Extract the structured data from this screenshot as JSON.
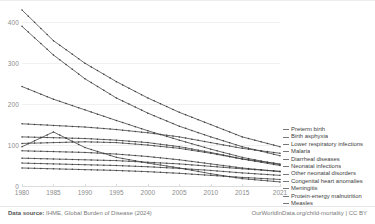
{
  "footer": {
    "source_label": "Data source:",
    "source_text": "IHME, Global Burden of Disease (2024)",
    "attribution": "OurWorldInData.org/child-mortality | CC BY"
  },
  "chart_data": {
    "type": "line",
    "title": "",
    "xlabel": "",
    "ylabel": "",
    "grid": true,
    "legend_position": "right",
    "xlim": [
      1980,
      2021
    ],
    "ylim": [
      0,
      430
    ],
    "yticks": [
      0,
      100,
      200,
      300,
      400
    ],
    "xticks": [
      1980,
      1985,
      1990,
      1995,
      2000,
      2005,
      2010,
      2015,
      2021
    ],
    "x": [
      1980,
      1985,
      1990,
      1995,
      2000,
      2005,
      2010,
      2015,
      2021
    ],
    "series": [
      {
        "name": "Preterm birth",
        "values": [
          430,
          355,
          300,
          255,
          215,
          180,
          150,
          120,
          96
        ]
      },
      {
        "name": "Birth asphyxia",
        "values": [
          390,
          320,
          262,
          215,
          178,
          146,
          120,
          96,
          74
        ]
      },
      {
        "name": "Lower respiratory infections",
        "values": [
          243,
          212,
          186,
          160,
          135,
          112,
          90,
          70,
          52
        ]
      },
      {
        "name": "Malaria",
        "values": [
          152,
          148,
          144,
          138,
          130,
          120,
          106,
          92,
          80
        ]
      },
      {
        "name": "Diarrheal diseases",
        "values": [
          120,
          118,
          116,
          112,
          106,
          96,
          82,
          66,
          50
        ]
      },
      {
        "name": "Neonatal infections",
        "values": [
          104,
          106,
          108,
          106,
          100,
          92,
          80,
          66,
          54
        ]
      },
      {
        "name": "Other neonatal disorders",
        "values": [
          86,
          84,
          82,
          78,
          72,
          64,
          54,
          44,
          35
        ]
      },
      {
        "name": "Congenital heart anomalies",
        "values": [
          68,
          66,
          64,
          62,
          58,
          54,
          48,
          42,
          36
        ]
      },
      {
        "name": "Meningitis",
        "values": [
          56,
          54,
          52,
          50,
          47,
          43,
          38,
          32,
          26
        ]
      },
      {
        "name": "Protein-energy malnutrition",
        "values": [
          44,
          42,
          40,
          38,
          35,
          31,
          26,
          21,
          16
        ]
      },
      {
        "name": "Measles",
        "values": [
          96,
          132,
          94,
          70,
          56,
          44,
          30,
          18,
          10
        ]
      }
    ]
  },
  "legend": {
    "items": [
      {
        "label": "Preterm birth"
      },
      {
        "label": "Birth asphyxia"
      },
      {
        "label": "Lower respiratory infections"
      },
      {
        "label": "Malaria"
      },
      {
        "label": "Diarrheal diseases"
      },
      {
        "label": "Neonatal infections"
      },
      {
        "label": "Other neonatal disorders"
      },
      {
        "label": "Congenital heart anomalies"
      },
      {
        "label": "Meningitis"
      },
      {
        "label": "Protein-energy malnutrition"
      },
      {
        "label": "Measles"
      }
    ]
  }
}
